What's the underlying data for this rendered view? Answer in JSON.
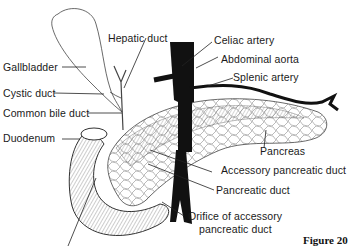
{
  "diagram": {
    "labels": {
      "gallbladder": "Gallbladder",
      "hepatic_duct": "Hepatic duct",
      "cystic_duct": "Cystic duct",
      "common_bile_duct": "Common bile duct",
      "duodenum": "Duodenum",
      "celiac_artery": "Celiac artery",
      "abdominal_aorta": "Abdominal aorta",
      "splenic_artery": "Splenic artery",
      "pancreas": "Pancreas",
      "accessory_pancreatic_duct": "Accessory pancreatic duct",
      "pancreatic_duct": "Pancreatic duct",
      "orifice_line1": "Orifice of accessory",
      "orifice_line2": "pancreatic duct"
    },
    "figure_caption": "Figure 20",
    "colors": {
      "ink": "#1a1a1a",
      "background": "#ffffff",
      "vessel": "#111111"
    }
  }
}
